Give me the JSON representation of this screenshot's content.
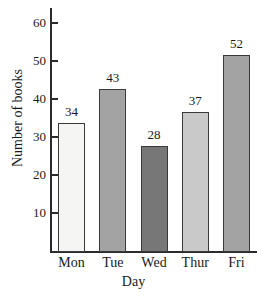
{
  "chart_data": {
    "type": "bar",
    "title": "",
    "xlabel": "Day",
    "ylabel": "Number of books",
    "categories": [
      "Mon",
      "Tue",
      "Wed",
      "Thur",
      "Fri"
    ],
    "values": [
      34,
      43,
      28,
      37,
      52
    ],
    "value_labels": [
      "34",
      "43",
      "28",
      "37",
      "52"
    ],
    "bar_colors": [
      "#f5f5f3",
      "#a3a3a3",
      "#777777",
      "#c9c9c9",
      "#a3a3a3"
    ],
    "bar_border_color": "#3a3a3a",
    "ylim": [
      0,
      64
    ],
    "yticks": [
      10,
      20,
      30,
      40,
      50,
      60
    ],
    "ytick_labels": [
      "10",
      "20",
      "30",
      "40",
      "50",
      "60"
    ],
    "grid": false,
    "legend": false,
    "axis_color": "#2b2b2b",
    "background": "#ffffff"
  }
}
